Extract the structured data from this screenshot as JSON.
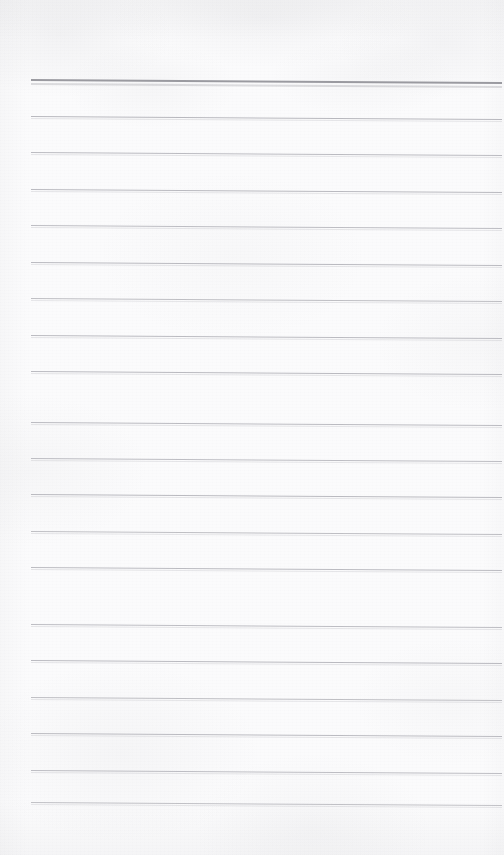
{
  "document": {
    "kind": "scanned-ruled-notepad-page",
    "title": "Blank Ruled Notepad Page",
    "content_text": "",
    "handwriting_present": "no",
    "printed_text_present": "no",
    "page_width": 504,
    "page_height": 855,
    "paper_color": "#fbfbfc",
    "paper_tint_color": "#f6f6f8",
    "scan_skew_px": 3
  },
  "ruling": {
    "line_count": 21,
    "line_spacing_px": 36.4,
    "first_line_y": 79,
    "left_margin_x": 31,
    "right_margin_x": 502,
    "line_length_px": 471,
    "header_rule_color": "#9a9aa0",
    "header_rule_thickness_px": 2,
    "body_rule_color": "#b9b9bf",
    "body_rule_thickness_px": 1,
    "vertical_margin_rule": "none",
    "lines": [
      {
        "index": 1,
        "y": 79,
        "role": "header-rule",
        "color": "#9a9aa0",
        "thickness": 2,
        "opacity": 1.0
      },
      {
        "index": 2,
        "y": 116,
        "role": "body-rule",
        "color": "#b6b6bc",
        "thickness": 1,
        "opacity": 0.96
      },
      {
        "index": 3,
        "y": 152,
        "role": "body-rule",
        "color": "#b8b8be",
        "thickness": 1,
        "opacity": 0.94
      },
      {
        "index": 4,
        "y": 189,
        "role": "body-rule",
        "color": "#b7b7bd",
        "thickness": 1,
        "opacity": 0.95
      },
      {
        "index": 5,
        "y": 225,
        "role": "body-rule",
        "color": "#b9b9bf",
        "thickness": 1,
        "opacity": 0.93
      },
      {
        "index": 6,
        "y": 262,
        "role": "body-rule",
        "color": "#b7b7bd",
        "thickness": 1,
        "opacity": 0.95
      },
      {
        "index": 7,
        "y": 298,
        "role": "body-rule",
        "color": "#bababf",
        "thickness": 1,
        "opacity": 0.92
      },
      {
        "index": 8,
        "y": 335,
        "role": "body-rule",
        "color": "#b8b8be",
        "thickness": 1,
        "opacity": 0.94
      },
      {
        "index": 9,
        "y": 371,
        "role": "body-rule",
        "color": "#b7b7bd",
        "thickness": 1,
        "opacity": 0.95
      },
      {
        "index": 10,
        "y": 386,
        "role": "skip",
        "color": "#000000",
        "thickness": 0,
        "opacity": 0.0
      },
      {
        "index": 11,
        "y": 422,
        "role": "body-rule",
        "color": "#b8b8be",
        "thickness": 1,
        "opacity": 0.94
      },
      {
        "index": 12,
        "y": 458,
        "role": "body-rule",
        "color": "#b9b9bf",
        "thickness": 1,
        "opacity": 0.93
      },
      {
        "index": 13,
        "y": 494,
        "role": "body-rule",
        "color": "#b7b7bd",
        "thickness": 1,
        "opacity": 0.95
      },
      {
        "index": 14,
        "y": 531,
        "role": "body-rule",
        "color": "#bababf",
        "thickness": 1,
        "opacity": 0.92
      },
      {
        "index": 15,
        "y": 567,
        "role": "body-rule",
        "color": "#b8b8be",
        "thickness": 1,
        "opacity": 0.94
      },
      {
        "index": 16,
        "y": 624,
        "role": "body-rule",
        "color": "#b9b9bf",
        "thickness": 1,
        "opacity": 0.93
      },
      {
        "index": 17,
        "y": 660,
        "role": "body-rule",
        "color": "#b7b7bd",
        "thickness": 1,
        "opacity": 0.95
      },
      {
        "index": 18,
        "y": 697,
        "role": "body-rule",
        "color": "#bababf",
        "thickness": 1,
        "opacity": 0.92
      },
      {
        "index": 19,
        "y": 733,
        "role": "body-rule",
        "color": "#b8b8be",
        "thickness": 1,
        "opacity": 0.94
      },
      {
        "index": 20,
        "y": 770,
        "role": "body-rule",
        "color": "#b9b9bf",
        "thickness": 1,
        "opacity": 0.93
      },
      {
        "index": 21,
        "y": 802,
        "role": "body-rule",
        "color": "#bbbbc0",
        "thickness": 1,
        "opacity": 0.9
      }
    ]
  },
  "margins": {
    "top_blank_height_px": 79,
    "bottom_blank_height_px": 53
  }
}
